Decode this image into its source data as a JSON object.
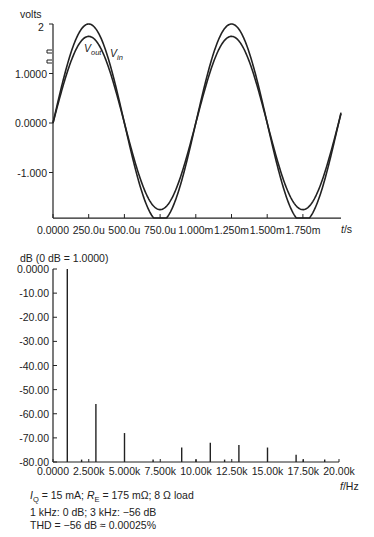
{
  "chart_data": [
    {
      "type": "line",
      "title": "",
      "ylabel": "volts",
      "xlabel": "t/s",
      "ylim": [
        -1.92,
        2.0
      ],
      "xlim": [
        0,
        0.00185
      ],
      "y_ticks": [
        "2",
        "1.0000",
        "0.0000",
        "-1.000"
      ],
      "y_tick_values": [
        2.0,
        1.0,
        0.0,
        -1.0
      ],
      "x_ticks": [
        "0.0000",
        "250.0u",
        "500.0u",
        "750.0u",
        "1.000m",
        "1.250m",
        "1.500m",
        "1.750m"
      ],
      "x_tick_values": [
        0,
        0.00025,
        0.0005,
        0.00075,
        0.001,
        0.00125,
        0.0015,
        0.00175
      ],
      "series": [
        {
          "name": "Vout",
          "label_main": "V",
          "label_sub": "out",
          "amplitude": 2.0,
          "frequency_hz": 1000
        },
        {
          "name": "Vin",
          "label_main": "V",
          "label_sub": "in",
          "amplitude": 1.75,
          "frequency_hz": 1000
        }
      ],
      "grid": false
    },
    {
      "type": "bar",
      "title": "dB (0 dB = 1.0000)",
      "ylabel": "dB (0 dB = 1.0000)",
      "xlabel": "f/Hz",
      "ylim": [
        -80,
        0
      ],
      "xlim": [
        0,
        20000
      ],
      "y_ticks": [
        "0.0000",
        "-10.00",
        "-20.00",
        "-30.00",
        "-40.00",
        "-50.00",
        "-60.00",
        "-70.00",
        "-80.00"
      ],
      "y_tick_values": [
        0,
        -10,
        -20,
        -30,
        -40,
        -50,
        -60,
        -70,
        -80
      ],
      "x_ticks": [
        "0.0000",
        "2.500k",
        "5.000k",
        "7.500k",
        "10.00k",
        "12.50k",
        "15.00k",
        "17.50k",
        "20.00k"
      ],
      "x_tick_values": [
        0,
        2500,
        5000,
        7500,
        10000,
        12500,
        15000,
        17500,
        20000
      ],
      "x": [
        1000,
        2000,
        3000,
        5000,
        7000,
        9000,
        10000,
        11000,
        12000,
        13000,
        15000,
        17000,
        17500,
        19000
      ],
      "values": [
        0,
        -79,
        -56,
        -68,
        -79,
        -74,
        -79,
        -72,
        -79,
        -73,
        -74,
        -77,
        -79,
        -79
      ],
      "grid": false
    }
  ],
  "top_plot": {
    "y_unit_label": "volts",
    "y_top_label": "2",
    "x_unit_label_italic": "t",
    "x_unit_label_rest": "/s",
    "legend": {
      "vout_main": "V",
      "vout_sub": "out",
      "vin_main": "V",
      "vin_sub": "in"
    }
  },
  "bottom_plot": {
    "y_unit_label": "dB (0 dB = 1.0000)",
    "x_unit_label_italic": "f",
    "x_unit_label_rest": "/Hz"
  },
  "caption": {
    "line1": "I_Q = 15 mA; R_E = 175 mΩ; 8 Ω load",
    "line1_parts": {
      "iq_main": "I",
      "iq_sub": "Q",
      "iq_rest": " = 15 mA; ",
      "re_main": "R",
      "re_sub": "E",
      "re_rest": " = 175 mΩ; 8 Ω load"
    },
    "line2": "1 kHz: 0 dB; 3 kHz: −56 dB",
    "line3": "THD = −56 dB ≈ 0.00025%"
  },
  "colors": {
    "line": "#222222",
    "background": "#ffffff"
  }
}
